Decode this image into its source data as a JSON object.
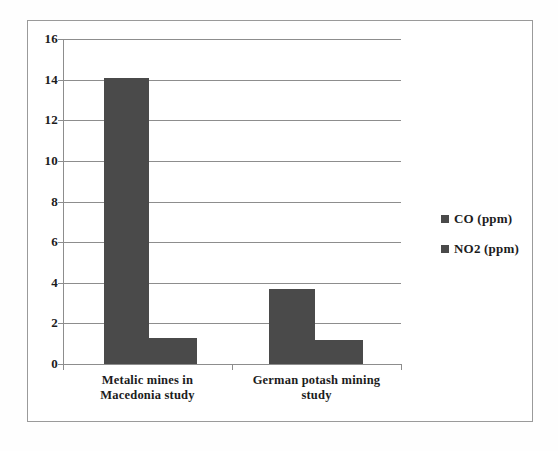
{
  "chart_data": {
    "type": "bar",
    "title": "",
    "subtitle": "",
    "xlabel": "",
    "ylabel": "",
    "categories": [
      "Metalic mines in Macedonia study",
      "German potash mining study"
    ],
    "category_lines": [
      [
        "Metalic mines in",
        "Macedonia study"
      ],
      [
        "German potash mining",
        "study"
      ]
    ],
    "series": [
      {
        "name": "CO (ppm)",
        "values": [
          14.1,
          3.7
        ],
        "color": "#4a4a4a"
      },
      {
        "name": "NO2 (ppm)",
        "values": [
          1.3,
          1.2
        ],
        "color": "#4a4a4a"
      }
    ],
    "ylim": [
      0,
      16
    ],
    "ytick_labels": [
      "16",
      "14",
      "12",
      "10",
      "8",
      "6",
      "4",
      "2",
      "0"
    ],
    "ytick_values": [
      16,
      14,
      12,
      10,
      8,
      6,
      4,
      2,
      0
    ],
    "grid": "horizontal",
    "legend_position": "right",
    "legend_entries": [
      "CO (ppm)",
      "NO2 (ppm)"
    ],
    "bar_color": "#4a4a4a",
    "grid_color": "#8d8d8d",
    "background": "#ffffff",
    "border_color": "#9a9a9a"
  }
}
